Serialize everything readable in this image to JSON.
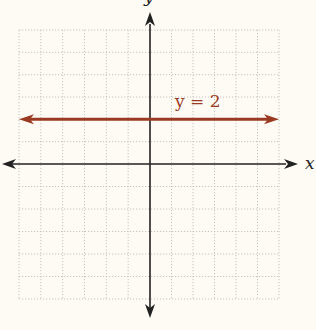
{
  "chart_data": {
    "type": "line",
    "title": "",
    "xlabel": "x",
    "ylabel": "y",
    "xlim": [
      -6,
      6
    ],
    "ylim": [
      -6,
      6
    ],
    "grid": true,
    "grid_style": "dotted",
    "grid_step": 1,
    "tick_labels": false,
    "series": [
      {
        "name": "y = 2",
        "equation": "y = 2",
        "type": "horizontal-line",
        "x": [
          -6,
          6
        ],
        "y": [
          2,
          2
        ],
        "arrows": "both",
        "color": "#9b3a22",
        "label_position": {
          "x": 1.4,
          "y": 2.6
        }
      }
    ],
    "annotations": [
      {
        "text": "y = 2",
        "x": 1.4,
        "y": 2.6
      }
    ]
  },
  "labels": {
    "x_axis": "x",
    "y_axis": "y",
    "line": "y = 2"
  },
  "colors": {
    "background": "#fdfbf4",
    "axis": "#222222",
    "grid": "#b8b8b8",
    "line": "#9b3a22"
  }
}
